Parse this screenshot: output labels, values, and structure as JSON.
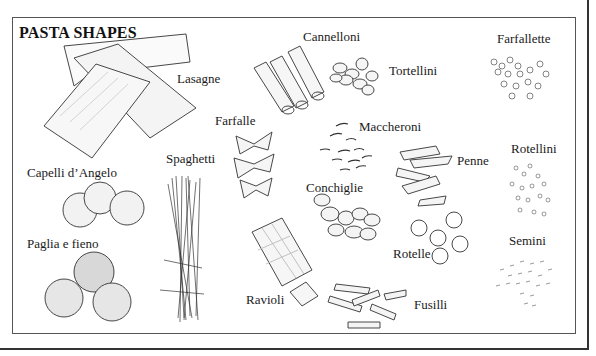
{
  "title": "PASTA SHAPES",
  "labels": {
    "lasagne": "Lasagne",
    "cannelloni": "Cannelloni",
    "tortellini": "Tortellini",
    "farfallette": "Farfallette",
    "farfalle": "Farfalle",
    "maccheroni": "Maccheroni",
    "spaghetti": "Spaghetti",
    "capelli": "Capelli d’Angelo",
    "penne": "Penne",
    "rotellini": "Rotellini",
    "conchiglie": "Conchiglie",
    "paglia": "Paglia e fieno",
    "rotelle": "Rotelle",
    "semini": "Semini",
    "ravioli": "Ravioli",
    "fusilli": "Fusilli"
  },
  "colors": {
    "ink": "#333333",
    "frame": "#555555",
    "background": "#ffffff"
  }
}
